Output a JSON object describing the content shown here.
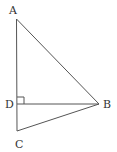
{
  "diagram": {
    "type": "geometry-triangle",
    "points": {
      "A": {
        "label": "A",
        "x": 16,
        "y": 19
      },
      "B": {
        "label": "B",
        "x": 99,
        "y": 104
      },
      "C": {
        "label": "C",
        "x": 17,
        "y": 131
      },
      "D": {
        "label": "D",
        "x": 17,
        "y": 104
      }
    },
    "segments": [
      "AB",
      "BC",
      "AC",
      "DB"
    ],
    "right_angle_marker": "D",
    "stroke_color": "#555555"
  }
}
